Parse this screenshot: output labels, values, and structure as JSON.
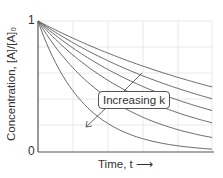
{
  "chart_data": {
    "type": "line",
    "title": "",
    "xlabel": "Time, t →",
    "ylabel": "Concentration, [A]/[A]₀",
    "y_ticks": [
      "0",
      "1"
    ],
    "x_ticks": [],
    "ylim": [
      0,
      1
    ],
    "grid": true,
    "annotation": "Increasing k",
    "x": [
      0,
      0.2,
      0.4,
      0.6,
      0.8,
      1.0
    ],
    "series": [
      {
        "name": "k1",
        "k": 0.7,
        "values": [
          1.0,
          0.87,
          0.76,
          0.66,
          0.57,
          0.5
        ]
      },
      {
        "name": "k2",
        "k": 0.9,
        "values": [
          1.0,
          0.84,
          0.7,
          0.58,
          0.49,
          0.41
        ]
      },
      {
        "name": "k3",
        "k": 1.15,
        "values": [
          1.0,
          0.79,
          0.63,
          0.5,
          0.4,
          0.32
        ]
      },
      {
        "name": "k4",
        "k": 1.5,
        "values": [
          1.0,
          0.74,
          0.55,
          0.41,
          0.3,
          0.22
        ]
      },
      {
        "name": "k5",
        "k": 2.2,
        "values": [
          1.0,
          0.64,
          0.41,
          0.27,
          0.17,
          0.11
        ]
      },
      {
        "name": "k6",
        "k": 3.8,
        "values": [
          1.0,
          0.47,
          0.22,
          0.1,
          0.05,
          0.02
        ]
      }
    ]
  },
  "labels": {
    "ylabel": "Concentration, [A]/[A]₀",
    "xlabel": "Time, t ⟶",
    "ytick_top": "1",
    "ytick_bottom": "0",
    "annotation": "Increasing k"
  },
  "colors": {
    "curve": "#6a6a6a",
    "axis": "#555555",
    "grid": "#e6e6e6"
  }
}
